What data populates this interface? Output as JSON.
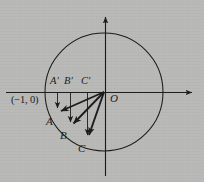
{
  "figure": {
    "type": "unit-circle-vector-diagram",
    "background_color": "#b9b9b7",
    "stroke_color": "#1a1a1a",
    "width": 204,
    "height": 182,
    "origin": {
      "x": 105,
      "y": 92,
      "label": "O"
    },
    "circle": {
      "cx": 104,
      "cy": 92,
      "r": 59
    },
    "axes": {
      "x_axis": {
        "y": 92,
        "x_start": 6,
        "x_end": 196,
        "arrow": "right"
      },
      "y_axis": {
        "x": 105,
        "y_start": 176,
        "y_end": 13,
        "arrow": "up"
      }
    },
    "labels": {
      "origin": "O",
      "left_intercept": "(−1, 0)",
      "a_prime": "A′",
      "b_prime": "B′",
      "c_prime": "C′",
      "a": "A",
      "b": "B",
      "c": "C"
    },
    "vectors": [
      {
        "name": "OA",
        "from": {
          "x": 105,
          "y": 92
        },
        "to": {
          "x": 57,
          "y": 113
        },
        "tip_label": "A"
      },
      {
        "name": "OB",
        "from": {
          "x": 105,
          "y": 92
        },
        "to": {
          "x": 70,
          "y": 127
        },
        "tip_label": "B"
      },
      {
        "name": "OC",
        "from": {
          "x": 105,
          "y": 92
        },
        "to": {
          "x": 87,
          "y": 140
        },
        "tip_label": "C"
      }
    ],
    "projections": [
      {
        "name": "A-projection",
        "x": 57,
        "y_start": 92,
        "y_end": 113,
        "top_label": "A′",
        "bottom_label": "A"
      },
      {
        "name": "B-projection",
        "x": 70,
        "y_start": 92,
        "y_end": 127,
        "top_label": "B′",
        "bottom_label": "B"
      },
      {
        "name": "C-projection",
        "x": 87,
        "y_start": 92,
        "y_end": 140,
        "top_label": "C′",
        "bottom_label": "C"
      }
    ],
    "label_positions": {
      "a_prime": {
        "x": 50,
        "y": 78
      },
      "b_prime": {
        "x": 64,
        "y": 78
      },
      "c_prime": {
        "x": 81,
        "y": 78
      },
      "left_intercept": {
        "x": 12,
        "y": 95
      },
      "origin": {
        "x": 109,
        "y": 93
      },
      "a": {
        "x": 46,
        "y": 118
      },
      "b": {
        "x": 60,
        "y": 132
      },
      "c": {
        "x": 78,
        "y": 146
      }
    }
  }
}
